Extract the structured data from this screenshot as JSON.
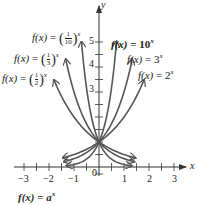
{
  "caption": {
    "text": "f(x) = a^x",
    "lhs": "f(x)",
    "eq": "=",
    "base": "a",
    "exp": "x"
  },
  "axes": {
    "x_label": "x",
    "y_label": "y",
    "x_ticks": [
      "−3",
      "−2",
      "−1",
      "0",
      "1",
      "2",
      "3"
    ],
    "y_ticks": [
      "3",
      "4",
      "5"
    ],
    "origin_label": "0"
  },
  "labels": [
    {
      "id": "tenth",
      "lhs": "f(x)",
      "eq": "=",
      "num": "1",
      "den": "10",
      "exp": "x"
    },
    {
      "id": "third",
      "lhs": "f(x)",
      "eq": "=",
      "num": "1",
      "den": "3",
      "exp": "x"
    },
    {
      "id": "half",
      "lhs": "f(x)",
      "eq": "=",
      "num": "1",
      "den": "2",
      "exp": "x"
    },
    {
      "id": "ten",
      "lhs": "f(x)",
      "eq": "=",
      "base": "10",
      "exp": "x"
    },
    {
      "id": "three",
      "lhs": "f(x)",
      "eq": "=",
      "base": "3",
      "exp": "x"
    },
    {
      "id": "two",
      "lhs": "f(x)",
      "eq": "=",
      "base": "2",
      "exp": "x"
    }
  ],
  "colors": {
    "curve": "#555555",
    "axis": "#333333",
    "text": "#222222"
  },
  "chart_data": {
    "type": "line",
    "xlabel": "x",
    "ylabel": "y",
    "xlim": [
      -3,
      3
    ],
    "ylim": [
      0,
      5
    ],
    "x_ticks": [
      -3,
      -2,
      -1,
      0,
      1,
      2,
      3
    ],
    "x_minor_step": 0.5,
    "y_ticks_labeled": [
      3,
      4,
      5
    ],
    "y_minor_step": 0.5,
    "grid": false,
    "legend": "inline labels with arrows",
    "series": [
      {
        "name": "f(x) = 10^x",
        "base": 10,
        "x_range": [
          -1.3,
          0.7
        ]
      },
      {
        "name": "f(x) = 3^x",
        "base": 3,
        "x_range": [
          -1.4,
          1.33
        ]
      },
      {
        "name": "f(x) = 2^x",
        "base": 2,
        "x_range": [
          -1.45,
          1.8
        ]
      },
      {
        "name": "f(x) = (1/10)^x",
        "base": 0.1,
        "x_range": [
          -0.7,
          1.3
        ]
      },
      {
        "name": "f(x) = (1/3)^x",
        "base": 0.3333,
        "x_range": [
          -1.33,
          1.4
        ]
      },
      {
        "name": "f(x) = (1/2)^x",
        "base": 0.5,
        "x_range": [
          -1.8,
          1.45
        ]
      }
    ],
    "annotations": [
      "All curves pass through (0, 1)"
    ]
  }
}
